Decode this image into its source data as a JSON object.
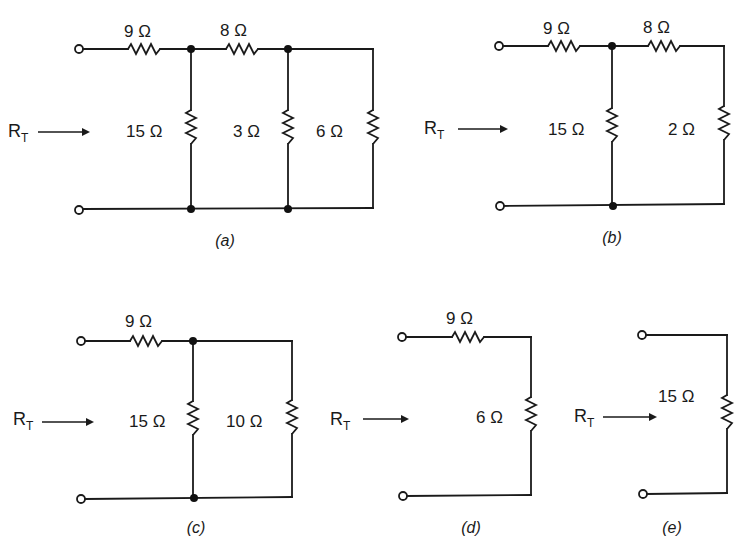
{
  "figure": {
    "input_label": "R",
    "input_label_subscript": "T",
    "circuits": [
      {
        "id": "a",
        "caption": "(a)",
        "resistors": [
          {
            "name": "series-1",
            "label": "9 Ω",
            "value_ohms": 9,
            "orientation": "horizontal"
          },
          {
            "name": "shunt-1",
            "label": "15 Ω",
            "value_ohms": 15,
            "orientation": "vertical"
          },
          {
            "name": "series-2",
            "label": "8 Ω",
            "value_ohms": 8,
            "orientation": "horizontal"
          },
          {
            "name": "shunt-2",
            "label": "3 Ω",
            "value_ohms": 3,
            "orientation": "vertical"
          },
          {
            "name": "shunt-3",
            "label": "6 Ω",
            "value_ohms": 6,
            "orientation": "vertical"
          }
        ]
      },
      {
        "id": "b",
        "caption": "(b)",
        "resistors": [
          {
            "name": "series-1",
            "label": "9 Ω",
            "value_ohms": 9,
            "orientation": "horizontal"
          },
          {
            "name": "shunt-1",
            "label": "15 Ω",
            "value_ohms": 15,
            "orientation": "vertical"
          },
          {
            "name": "series-2",
            "label": "8 Ω",
            "value_ohms": 8,
            "orientation": "horizontal"
          },
          {
            "name": "shunt-2",
            "label": "2 Ω",
            "value_ohms": 2,
            "orientation": "vertical"
          }
        ]
      },
      {
        "id": "c",
        "caption": "(c)",
        "resistors": [
          {
            "name": "series-1",
            "label": "9 Ω",
            "value_ohms": 9,
            "orientation": "horizontal"
          },
          {
            "name": "shunt-1",
            "label": "15 Ω",
            "value_ohms": 15,
            "orientation": "vertical"
          },
          {
            "name": "shunt-2",
            "label": "10 Ω",
            "value_ohms": 10,
            "orientation": "vertical"
          }
        ]
      },
      {
        "id": "d",
        "caption": "(d)",
        "resistors": [
          {
            "name": "series-1",
            "label": "9 Ω",
            "value_ohms": 9,
            "orientation": "horizontal"
          },
          {
            "name": "shunt-1",
            "label": "6 Ω",
            "value_ohms": 6,
            "orientation": "vertical"
          }
        ]
      },
      {
        "id": "e",
        "caption": "(e)",
        "resistors": [
          {
            "name": "shunt-1",
            "label": "15 Ω",
            "value_ohms": 15,
            "orientation": "vertical"
          }
        ]
      }
    ]
  }
}
